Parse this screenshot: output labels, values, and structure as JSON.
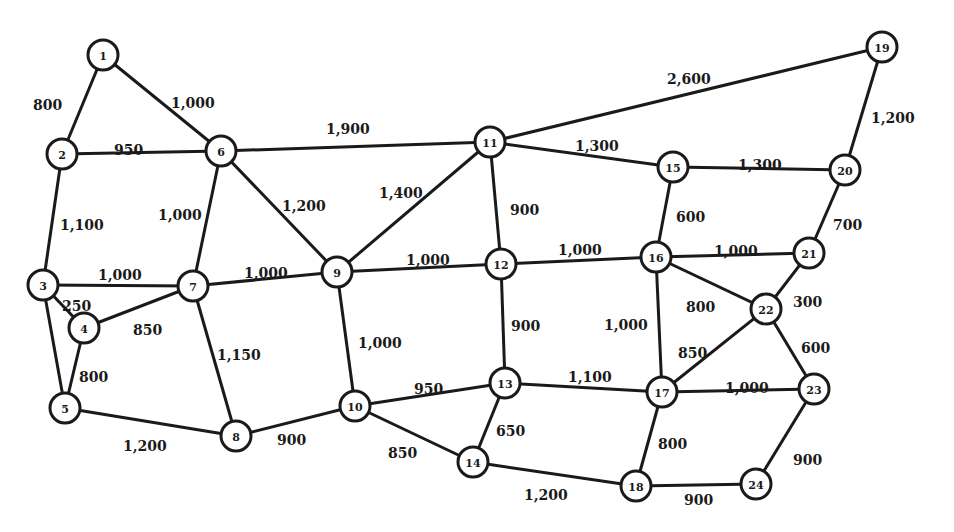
{
  "diagram": {
    "type": "weighted-undirected-network",
    "node_radius": 15,
    "colors": {
      "stroke": "#1a1a1a",
      "fill": "#ffffff",
      "background": "#ffffff"
    },
    "nodes": [
      {
        "id": "1",
        "x": 103,
        "y": 55
      },
      {
        "id": "2",
        "x": 62,
        "y": 154
      },
      {
        "id": "3",
        "x": 43,
        "y": 285
      },
      {
        "id": "4",
        "x": 84,
        "y": 328
      },
      {
        "id": "5",
        "x": 65,
        "y": 408
      },
      {
        "id": "6",
        "x": 221,
        "y": 151
      },
      {
        "id": "7",
        "x": 193,
        "y": 286
      },
      {
        "id": "8",
        "x": 236,
        "y": 436
      },
      {
        "id": "9",
        "x": 337,
        "y": 272
      },
      {
        "id": "10",
        "x": 355,
        "y": 406
      },
      {
        "id": "11",
        "x": 490,
        "y": 142
      },
      {
        "id": "12",
        "x": 501,
        "y": 264
      },
      {
        "id": "13",
        "x": 505,
        "y": 383
      },
      {
        "id": "14",
        "x": 473,
        "y": 462
      },
      {
        "id": "15",
        "x": 673,
        "y": 167
      },
      {
        "id": "16",
        "x": 656,
        "y": 257
      },
      {
        "id": "17",
        "x": 662,
        "y": 392
      },
      {
        "id": "18",
        "x": 636,
        "y": 486
      },
      {
        "id": "19",
        "x": 882,
        "y": 47
      },
      {
        "id": "20",
        "x": 845,
        "y": 170
      },
      {
        "id": "21",
        "x": 809,
        "y": 253
      },
      {
        "id": "22",
        "x": 766,
        "y": 309
      },
      {
        "id": "23",
        "x": 814,
        "y": 389
      },
      {
        "id": "24",
        "x": 756,
        "y": 484
      }
    ],
    "edges": [
      {
        "from": "1",
        "to": "2",
        "weight": "800",
        "lx": 33,
        "ly": 105
      },
      {
        "from": "1",
        "to": "6",
        "weight": "1,000",
        "lx": 171,
        "ly": 103
      },
      {
        "from": "2",
        "to": "6",
        "weight": "950",
        "lx": 114,
        "ly": 150
      },
      {
        "from": "2",
        "to": "3",
        "weight": "1,100",
        "lx": 60,
        "ly": 225
      },
      {
        "from": "6",
        "to": "7",
        "weight": "1,000",
        "lx": 158,
        "ly": 215
      },
      {
        "from": "6",
        "to": "11",
        "weight": "1,900",
        "lx": 326,
        "ly": 129
      },
      {
        "from": "6",
        "to": "9",
        "weight": "1,200",
        "lx": 282,
        "ly": 206
      },
      {
        "from": "3",
        "to": "7",
        "weight": "1,000",
        "lx": 98,
        "ly": 275
      },
      {
        "from": "3",
        "to": "4",
        "weight": "250",
        "lx": 62,
        "ly": 306
      },
      {
        "from": "3",
        "to": "5",
        "weight": "",
        "lx": 0,
        "ly": 0
      },
      {
        "from": "4",
        "to": "7",
        "weight": "850",
        "lx": 133,
        "ly": 330
      },
      {
        "from": "4",
        "to": "5",
        "weight": "800",
        "lx": 79,
        "ly": 377
      },
      {
        "from": "5",
        "to": "8",
        "weight": "1,200",
        "lx": 123,
        "ly": 446
      },
      {
        "from": "7",
        "to": "9",
        "weight": "1,000",
        "lx": 244,
        "ly": 273
      },
      {
        "from": "7",
        "to": "8",
        "weight": "1,150",
        "lx": 217,
        "ly": 355
      },
      {
        "from": "8",
        "to": "10",
        "weight": "900",
        "lx": 277,
        "ly": 440
      },
      {
        "from": "9",
        "to": "11",
        "weight": "1,400",
        "lx": 379,
        "ly": 193
      },
      {
        "from": "9",
        "to": "12",
        "weight": "1,000",
        "lx": 406,
        "ly": 260
      },
      {
        "from": "9",
        "to": "10",
        "weight": "1,000",
        "lx": 358,
        "ly": 343
      },
      {
        "from": "10",
        "to": "13",
        "weight": "950",
        "lx": 414,
        "ly": 389
      },
      {
        "from": "10",
        "to": "14",
        "weight": "850",
        "lx": 388,
        "ly": 453
      },
      {
        "from": "11",
        "to": "12",
        "weight": "900",
        "lx": 510,
        "ly": 210
      },
      {
        "from": "11",
        "to": "15",
        "weight": "1,300",
        "lx": 575,
        "ly": 146
      },
      {
        "from": "11",
        "to": "19",
        "weight": "2,600",
        "lx": 667,
        "ly": 79
      },
      {
        "from": "12",
        "to": "16",
        "weight": "1,000",
        "lx": 558,
        "ly": 250
      },
      {
        "from": "12",
        "to": "13",
        "weight": "900",
        "lx": 511,
        "ly": 326
      },
      {
        "from": "13",
        "to": "17",
        "weight": "1,100",
        "lx": 568,
        "ly": 377
      },
      {
        "from": "13",
        "to": "14",
        "weight": "650",
        "lx": 496,
        "ly": 431
      },
      {
        "from": "14",
        "to": "18",
        "weight": "1,200",
        "lx": 524,
        "ly": 495
      },
      {
        "from": "15",
        "to": "20",
        "weight": "1,300",
        "lx": 738,
        "ly": 165
      },
      {
        "from": "15",
        "to": "16",
        "weight": "600",
        "lx": 676,
        "ly": 217
      },
      {
        "from": "16",
        "to": "21",
        "weight": "1,000",
        "lx": 714,
        "ly": 251
      },
      {
        "from": "16",
        "to": "22",
        "weight": "800",
        "lx": 686,
        "ly": 307
      },
      {
        "from": "16",
        "to": "17",
        "weight": "1,000",
        "lx": 604,
        "ly": 325
      },
      {
        "from": "17",
        "to": "22",
        "weight": "850",
        "lx": 678,
        "ly": 353
      },
      {
        "from": "17",
        "to": "23",
        "weight": "1,000",
        "lx": 725,
        "ly": 388
      },
      {
        "from": "17",
        "to": "18",
        "weight": "800",
        "lx": 658,
        "ly": 444
      },
      {
        "from": "18",
        "to": "24",
        "weight": "900",
        "lx": 684,
        "ly": 500
      },
      {
        "from": "19",
        "to": "20",
        "weight": "1,200",
        "lx": 871,
        "ly": 118
      },
      {
        "from": "20",
        "to": "21",
        "weight": "700",
        "lx": 833,
        "ly": 225
      },
      {
        "from": "21",
        "to": "22",
        "weight": "300",
        "lx": 793,
        "ly": 302
      },
      {
        "from": "22",
        "to": "23",
        "weight": "600",
        "lx": 801,
        "ly": 348
      },
      {
        "from": "23",
        "to": "24",
        "weight": "900",
        "lx": 793,
        "ly": 460
      }
    ]
  }
}
